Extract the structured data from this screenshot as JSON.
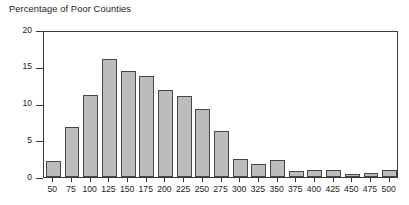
{
  "chart_data": {
    "type": "bar",
    "title": "Percentage of Poor Counties",
    "xlabel": "",
    "ylabel": "",
    "grid": false,
    "legend": "none",
    "ylim": [
      0,
      20
    ],
    "yticks": [
      0,
      5,
      10,
      15,
      20
    ],
    "ytick_labels": [
      "0",
      "5",
      "10",
      "15",
      "20"
    ],
    "categories": [
      "50",
      "75",
      "100",
      "125",
      "150",
      "175",
      "200",
      "225",
      "250",
      "275",
      "300",
      "325",
      "350",
      "375",
      "400",
      "425",
      "450",
      "475",
      "500"
    ],
    "values": [
      2.2,
      6.8,
      11.1,
      16.0,
      14.4,
      13.7,
      11.8,
      11.0,
      9.2,
      6.2,
      2.5,
      1.8,
      2.3,
      0.8,
      1.0,
      0.9,
      0.4,
      0.6,
      0.9
    ],
    "bar_color": "#bcbcbc",
    "bar_edge_color": "#474747",
    "axis_color": "#3a3a3a"
  }
}
